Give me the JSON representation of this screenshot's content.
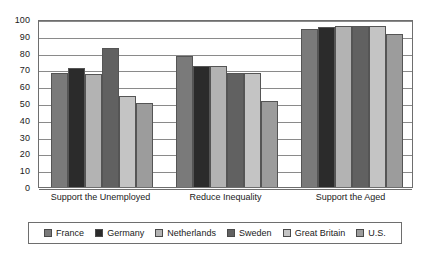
{
  "chart_data": {
    "type": "bar",
    "title": "",
    "subtitle": "",
    "xlabel": "",
    "ylabel": "",
    "ylim": [
      0,
      100
    ],
    "yticks": [
      0,
      10,
      20,
      30,
      40,
      50,
      60,
      70,
      80,
      90,
      100
    ],
    "grid": "horizontal",
    "legend_position": "bottom",
    "categories": [
      "Support the Unemployed",
      "Reduce Inequality",
      "Support the Aged"
    ],
    "series": [
      {
        "name": "France",
        "color": "#7a7a7a",
        "values": [
          68,
          78,
          94
        ]
      },
      {
        "name": "Germany",
        "color": "#2b2b2b",
        "values": [
          71,
          72,
          95
        ]
      },
      {
        "name": "Netherlands",
        "color": "#b3b3b3",
        "values": [
          67,
          72,
          96
        ]
      },
      {
        "name": "Sweden",
        "color": "#616161",
        "values": [
          83,
          68,
          96
        ]
      },
      {
        "name": "Great Britain",
        "color": "#c4c4c4",
        "values": [
          54,
          68,
          96
        ]
      },
      {
        "name": "U.S.",
        "color": "#9c9c9c",
        "values": [
          50,
          51,
          91
        ]
      }
    ]
  },
  "axis": {
    "y_tick_labels": [
      "100",
      "90",
      "80",
      "70",
      "60",
      "50",
      "40",
      "30",
      "20",
      "10",
      "0"
    ]
  },
  "legend": {
    "items": [
      {
        "label": "France"
      },
      {
        "label": "Germany"
      },
      {
        "label": "Netherlands"
      },
      {
        "label": "Sweden"
      },
      {
        "label": "Great Britain"
      },
      {
        "label": "U.S."
      }
    ]
  }
}
